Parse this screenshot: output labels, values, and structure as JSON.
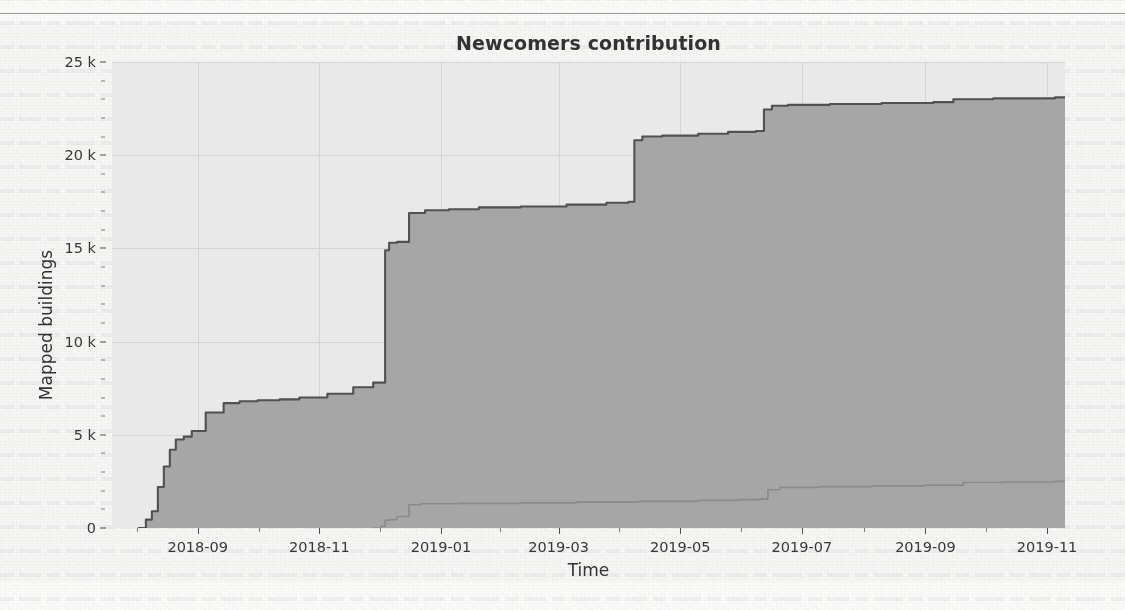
{
  "page": {
    "background_color": "#fbfbfa",
    "rule_color": "#8d8d90"
  },
  "chart_data": {
    "type": "area",
    "title": "Newcomers contribution",
    "xlabel": "Time",
    "ylabel": "Mapped buildings",
    "grid": true,
    "legend": "none",
    "xlim": [
      "2018-07-20",
      "2019-11-10"
    ],
    "ylim": [
      0,
      25000
    ],
    "ytick_labels": [
      "0",
      "5 k",
      "10 k",
      "15 k",
      "20 k",
      "25 k"
    ],
    "ytick_values": [
      0,
      5000,
      10000,
      15000,
      20000,
      25000
    ],
    "xtick_labels": [
      "2018-09",
      "2018-11",
      "2019-01",
      "2019-03",
      "2019-05",
      "2019-07",
      "2019-09",
      "2019-11"
    ],
    "xtick_values": [
      "2018-09",
      "2018-11",
      "2019-01",
      "2019-03",
      "2019-05",
      "2019-07",
      "2019-09",
      "2019-11"
    ],
    "area_fill_color": "#a8a8a8",
    "plot_background_color": "#ededed",
    "series": [
      {
        "name": "Total mapped buildings",
        "line_color": "#4f4f4f",
        "fill_color": "#a8a8a8",
        "x": [
          "2018-08-02",
          "2018-08-06",
          "2018-08-09",
          "2018-08-12",
          "2018-08-15",
          "2018-08-18",
          "2018-08-21",
          "2018-08-25",
          "2018-08-29",
          "2018-09-05",
          "2018-09-14",
          "2018-09-22",
          "2018-10-01",
          "2018-10-12",
          "2018-10-22",
          "2018-11-05",
          "2018-11-18",
          "2018-11-28",
          "2018-12-02",
          "2018-12-04",
          "2018-12-06",
          "2018-12-10",
          "2018-12-16",
          "2018-12-24",
          "2019-01-05",
          "2019-01-20",
          "2019-02-10",
          "2019-03-05",
          "2019-03-25",
          "2019-04-05",
          "2019-04-08",
          "2019-04-12",
          "2019-04-22",
          "2019-05-10",
          "2019-05-25",
          "2019-06-08",
          "2019-06-12",
          "2019-06-16",
          "2019-06-24",
          "2019-07-15",
          "2019-08-10",
          "2019-09-05",
          "2019-09-15",
          "2019-10-05",
          "2019-11-05"
        ],
        "y": [
          0,
          450,
          900,
          2200,
          3300,
          4200,
          4750,
          4900,
          5200,
          6200,
          6700,
          6800,
          6850,
          6900,
          7000,
          7200,
          7550,
          7800,
          7800,
          14900,
          15300,
          15350,
          16900,
          17050,
          17100,
          17200,
          17250,
          17350,
          17450,
          17500,
          20800,
          21000,
          21050,
          21150,
          21250,
          21300,
          22450,
          22650,
          22700,
          22750,
          22800,
          22850,
          23000,
          23050,
          23100
        ]
      },
      {
        "name": "Newcomers mapped buildings",
        "line_color": "#8a8a8a",
        "fill_color": "#a8a8a8",
        "x": [
          "2018-11-28",
          "2018-12-02",
          "2018-12-04",
          "2018-12-06",
          "2018-12-10",
          "2018-12-16",
          "2018-12-22",
          "2019-01-10",
          "2019-02-10",
          "2019-03-10",
          "2019-04-10",
          "2019-05-10",
          "2019-05-30",
          "2019-06-10",
          "2019-06-14",
          "2019-06-20",
          "2019-07-10",
          "2019-08-05",
          "2019-09-01",
          "2019-09-20",
          "2019-10-10",
          "2019-11-05"
        ],
        "y": [
          0,
          100,
          420,
          450,
          620,
          1250,
          1300,
          1320,
          1350,
          1390,
          1430,
          1480,
          1520,
          1550,
          2050,
          2180,
          2220,
          2260,
          2300,
          2440,
          2470,
          2500
        ]
      }
    ]
  }
}
